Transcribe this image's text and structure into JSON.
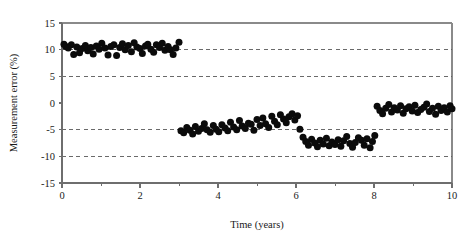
{
  "chart_data": {
    "type": "scatter",
    "title": "",
    "subtitle": "",
    "xlabel": "Time (years)",
    "ylabel": "Measurement error (%)",
    "xlim": [
      0,
      10
    ],
    "ylim": [
      -15,
      15
    ],
    "x_ticks": [
      0,
      2,
      4,
      6,
      8,
      10
    ],
    "x_tick_labels": [
      "0",
      "2",
      "4",
      "6",
      "8",
      "10"
    ],
    "x_minor_ticks": [
      1,
      3,
      5,
      7,
      9
    ],
    "y_ticks": [
      15,
      10,
      5,
      0,
      -5,
      -10,
      -15
    ],
    "y_tick_labels": [
      "15",
      "10",
      "5",
      "0",
      "-5",
      "-10",
      "-15"
    ],
    "grid": true,
    "gridlines_y": [
      10,
      5,
      -5,
      -10
    ],
    "gridline_style": "dashed",
    "legend": null,
    "legend_position": "none",
    "marker_color": "#0b0b0b",
    "marker_shape": "circle",
    "marker_size_px": 7,
    "annotations": [],
    "series": [
      {
        "name": "Measurement error",
        "color": "#0b0b0b",
        "points": [
          [
            0.05,
            11.0
          ],
          [
            0.1,
            10.6
          ],
          [
            0.16,
            10.3
          ],
          [
            0.24,
            10.9
          ],
          [
            0.3,
            9.1
          ],
          [
            0.38,
            10.5
          ],
          [
            0.45,
            9.4
          ],
          [
            0.52,
            10.2
          ],
          [
            0.6,
            10.8
          ],
          [
            0.66,
            9.8
          ],
          [
            0.74,
            10.4
          ],
          [
            0.8,
            9.2
          ],
          [
            0.88,
            10.7
          ],
          [
            0.95,
            10.1
          ],
          [
            1.02,
            11.2
          ],
          [
            1.1,
            10.3
          ],
          [
            1.18,
            9.0
          ],
          [
            1.25,
            10.6
          ],
          [
            1.33,
            10.9
          ],
          [
            1.4,
            8.9
          ],
          [
            1.48,
            10.4
          ],
          [
            1.55,
            11.1
          ],
          [
            1.62,
            10.0
          ],
          [
            1.7,
            10.8
          ],
          [
            1.78,
            9.6
          ],
          [
            1.85,
            11.3
          ],
          [
            1.92,
            10.5
          ],
          [
            2.0,
            10.2
          ],
          [
            2.06,
            9.3
          ],
          [
            2.14,
            10.7
          ],
          [
            2.2,
            11.0
          ],
          [
            2.28,
            10.1
          ],
          [
            2.35,
            9.5
          ],
          [
            2.42,
            10.9
          ],
          [
            2.5,
            10.4
          ],
          [
            2.57,
            11.2
          ],
          [
            2.64,
            9.9
          ],
          [
            2.72,
            10.6
          ],
          [
            2.78,
            10.0
          ],
          [
            2.85,
            9.1
          ],
          [
            2.92,
            10.3
          ],
          [
            3.0,
            11.4
          ],
          [
            3.05,
            -5.2
          ],
          [
            3.12,
            -5.6
          ],
          [
            3.2,
            -4.6
          ],
          [
            3.28,
            -5.1
          ],
          [
            3.35,
            -5.8
          ],
          [
            3.42,
            -4.4
          ],
          [
            3.5,
            -5.3
          ],
          [
            3.58,
            -4.8
          ],
          [
            3.65,
            -3.9
          ],
          [
            3.72,
            -5.0
          ],
          [
            3.8,
            -5.5
          ],
          [
            3.88,
            -4.2
          ],
          [
            3.95,
            -4.9
          ],
          [
            4.02,
            -5.4
          ],
          [
            4.1,
            -4.1
          ],
          [
            4.18,
            -4.7
          ],
          [
            4.25,
            -5.2
          ],
          [
            4.32,
            -3.6
          ],
          [
            4.4,
            -4.5
          ],
          [
            4.48,
            -5.0
          ],
          [
            4.55,
            -3.3
          ],
          [
            4.62,
            -4.3
          ],
          [
            4.7,
            -4.8
          ],
          [
            4.78,
            -3.8
          ],
          [
            4.85,
            -4.0
          ],
          [
            4.92,
            -5.1
          ],
          [
            5.0,
            -3.1
          ],
          [
            5.08,
            -4.2
          ],
          [
            5.15,
            -2.8
          ],
          [
            5.22,
            -3.9
          ],
          [
            5.3,
            -4.6
          ],
          [
            5.38,
            -2.5
          ],
          [
            5.45,
            -3.4
          ],
          [
            5.52,
            -4.1
          ],
          [
            5.6,
            -2.2
          ],
          [
            5.68,
            -3.0
          ],
          [
            5.75,
            -3.7
          ],
          [
            5.82,
            -2.6
          ],
          [
            5.9,
            -2.0
          ],
          [
            5.97,
            -3.2
          ],
          [
            6.04,
            -2.4
          ],
          [
            6.1,
            -4.9
          ],
          [
            6.18,
            -6.4
          ],
          [
            6.25,
            -7.2
          ],
          [
            6.32,
            -7.9
          ],
          [
            6.4,
            -6.8
          ],
          [
            6.48,
            -7.5
          ],
          [
            6.55,
            -8.2
          ],
          [
            6.62,
            -7.0
          ],
          [
            6.7,
            -7.7
          ],
          [
            6.78,
            -6.6
          ],
          [
            6.85,
            -8.0
          ],
          [
            6.92,
            -7.3
          ],
          [
            7.0,
            -7.8
          ],
          [
            7.08,
            -6.9
          ],
          [
            7.15,
            -8.1
          ],
          [
            7.22,
            -7.1
          ],
          [
            7.3,
            -6.3
          ],
          [
            7.38,
            -7.6
          ],
          [
            7.45,
            -8.3
          ],
          [
            7.52,
            -7.4
          ],
          [
            7.6,
            -6.5
          ],
          [
            7.68,
            -7.0
          ],
          [
            7.75,
            -7.9
          ],
          [
            7.82,
            -6.7
          ],
          [
            7.9,
            -8.4
          ],
          [
            7.96,
            -7.2
          ],
          [
            8.02,
            -6.1
          ],
          [
            8.08,
            -0.6
          ],
          [
            8.15,
            -1.4
          ],
          [
            8.22,
            -2.0
          ],
          [
            8.3,
            -1.0
          ],
          [
            8.38,
            -0.3
          ],
          [
            8.45,
            -1.7
          ],
          [
            8.52,
            -0.9
          ],
          [
            8.6,
            -1.3
          ],
          [
            8.68,
            -0.5
          ],
          [
            8.75,
            -1.9
          ],
          [
            8.82,
            -1.1
          ],
          [
            8.9,
            -0.7
          ],
          [
            8.98,
            -1.5
          ],
          [
            9.05,
            -0.4
          ],
          [
            9.12,
            -1.8
          ],
          [
            9.2,
            -1.2
          ],
          [
            9.28,
            -0.8
          ],
          [
            9.35,
            -0.2
          ],
          [
            9.42,
            -1.6
          ],
          [
            9.5,
            -1.0
          ],
          [
            9.58,
            -2.1
          ],
          [
            9.65,
            -0.6
          ],
          [
            9.72,
            -1.4
          ],
          [
            9.8,
            -0.9
          ],
          [
            9.88,
            -1.7
          ],
          [
            9.95,
            -0.5
          ],
          [
            10.0,
            -1.1
          ]
        ]
      }
    ]
  },
  "axes": {
    "y_title": "Measurement error (%)",
    "x_title": "Time (years)"
  }
}
